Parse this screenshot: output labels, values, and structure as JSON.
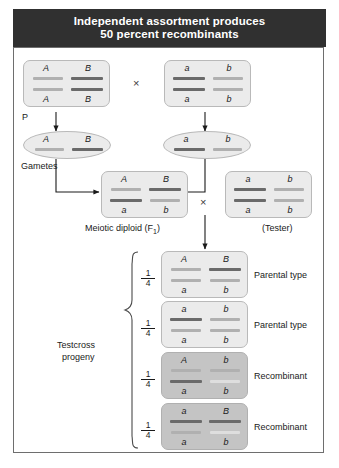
{
  "title": {
    "line1": "Independent assortment produces",
    "line2": "50 percent recombinants"
  },
  "labels": {
    "p": "P",
    "gametes": "Gametes",
    "meiotic_diploid": "Meiotic diploid (F",
    "meiotic_diploid_sub": "1",
    "meiotic_diploid_end": ")",
    "tester": "(Tester)",
    "testcross_line1": "Testcross",
    "testcross_line2": "progeny",
    "cross_symbol": "×"
  },
  "colors": {
    "title_bg": "#303030",
    "title_text": "#ffffff",
    "box_bg": "#ebebeb",
    "box_bg_dark": "#c4c4c4",
    "bar_light": "#b0b0b0",
    "bar_dark": "#6a6a6a",
    "frame_border": "#6e6e6e",
    "arrow": "#1a1a1a"
  },
  "parents": [
    {
      "name": "parent-1",
      "top_left": "A",
      "top_right": "B",
      "bottom_left": "A",
      "bottom_right": "B",
      "bar_tl": "light",
      "bar_tr": "dark",
      "bar_bl": "light",
      "bar_br": "dark"
    },
    {
      "name": "parent-2",
      "top_left": "a",
      "top_right": "b",
      "bottom_left": "a",
      "bottom_right": "b",
      "bar_tl": "dark",
      "bar_tr": "light",
      "bar_bl": "dark",
      "bar_br": "light"
    }
  ],
  "gametes": [
    {
      "name": "gamete-1",
      "left": "A",
      "right": "B",
      "bar_left": "light",
      "bar_right": "dark"
    },
    {
      "name": "gamete-2",
      "left": "a",
      "right": "b",
      "bar_left": "dark",
      "bar_right": "light"
    }
  ],
  "f1": {
    "top_left": "A",
    "top_right": "B",
    "bottom_left": "a",
    "bottom_right": "b",
    "bar_tl": "light",
    "bar_tr": "dark",
    "bar_bl": "dark",
    "bar_br": "light"
  },
  "tester": {
    "top_left": "a",
    "top_right": "b",
    "bottom_left": "a",
    "bottom_right": "b",
    "bar_tl": "dark",
    "bar_tr": "light",
    "bar_bl": "dark",
    "bar_br": "light"
  },
  "progeny": [
    {
      "fraction_num": "1",
      "fraction_den": "4",
      "top_left": "A",
      "top_right": "B",
      "bottom_left": "a",
      "bottom_right": "b",
      "bar_tl": "light",
      "bar_tr": "dark",
      "bar_bl": "light",
      "bar_br": "light",
      "type": "Parental type",
      "shaded": false
    },
    {
      "fraction_num": "1",
      "fraction_den": "4",
      "top_left": "a",
      "top_right": "b",
      "bottom_left": "a",
      "bottom_right": "b",
      "bar_tl": "dark",
      "bar_tr": "light",
      "bar_bl": "light",
      "bar_br": "light",
      "type": "Parental type",
      "shaded": false
    },
    {
      "fraction_num": "1",
      "fraction_den": "4",
      "top_left": "A",
      "top_right": "b",
      "bottom_left": "a",
      "bottom_right": "b",
      "bar_tl": "light",
      "bar_tr": "light",
      "bar_bl": "dark",
      "bar_br": "light",
      "type": "Recombinant",
      "shaded": true
    },
    {
      "fraction_num": "1",
      "fraction_den": "4",
      "top_left": "a",
      "top_right": "B",
      "bottom_left": "a",
      "bottom_right": "b",
      "bar_tl": "dark",
      "bar_tr": "dark",
      "bar_bl": "light",
      "bar_br": "light",
      "type": "Recombinant",
      "shaded": true
    }
  ]
}
